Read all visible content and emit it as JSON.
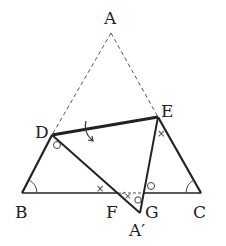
{
  "diagram": {
    "points": {
      "A": {
        "label": "A",
        "x": 111,
        "y": 33
      },
      "B": {
        "label": "B",
        "x": 22,
        "y": 193
      },
      "C": {
        "label": "C",
        "x": 201,
        "y": 193
      },
      "D": {
        "label": "D",
        "x": 52,
        "y": 135
      },
      "E": {
        "label": "E",
        "x": 158,
        "y": 117
      },
      "F": {
        "label": "F",
        "x": 118,
        "y": 193
      },
      "G": {
        "label": "G",
        "x": 144,
        "y": 193
      },
      "A_prime": {
        "label": "A′",
        "x": 140,
        "y": 213
      }
    },
    "labels": {
      "A": "A",
      "B": "B",
      "C": "C",
      "D": "D",
      "E": "E",
      "F": "F",
      "G": "G",
      "A_prime": "A′"
    },
    "markers": {
      "angle_arc": "arc",
      "circle_mark": "○",
      "cross_mark": "×",
      "fold_arrow": "curved-arrow"
    },
    "colors": {
      "solid_line": "#222222",
      "dashed_line": "#555555",
      "marks": "#444444"
    }
  }
}
